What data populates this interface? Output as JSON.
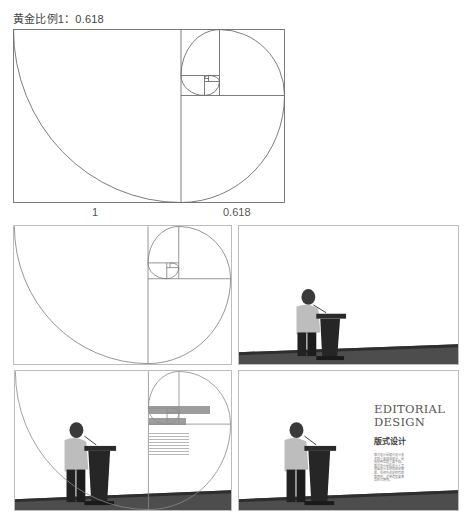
{
  "title": "黄金比例1：0.618",
  "main_diagram": {
    "label_left": "1",
    "label_right": "0.618",
    "stroke_color": "#6e6e6e"
  },
  "panels": [
    {
      "id": "spiral-only",
      "content": "golden spiral grid"
    },
    {
      "id": "speaker-photo",
      "content": "speaker at podium on stage"
    },
    {
      "id": "speaker-with-grid",
      "content": "speaker photo overlaid with golden spiral grid and layout blocks"
    },
    {
      "id": "speaker-final-layout",
      "content": "speaker photo with editorial text layout",
      "text": {
        "heading_line1": "EDITORIAL",
        "heading_line2": "DESIGN",
        "subheading": "版式设计",
        "body": "版式设计是现代设计艺术的重要组成部分，是视觉传达的重要手段。版式设计是指设计人员根据设计主题和视觉需求，在预先设定的有限版面内，运用造型要素及形式原则。"
      }
    }
  ],
  "colors": {
    "line": "#6e6e6e",
    "panel_border": "#bdbdbd",
    "bar_gray": "#8c8c8c",
    "floor": "#4a4a4a",
    "background": "#ffffff"
  }
}
